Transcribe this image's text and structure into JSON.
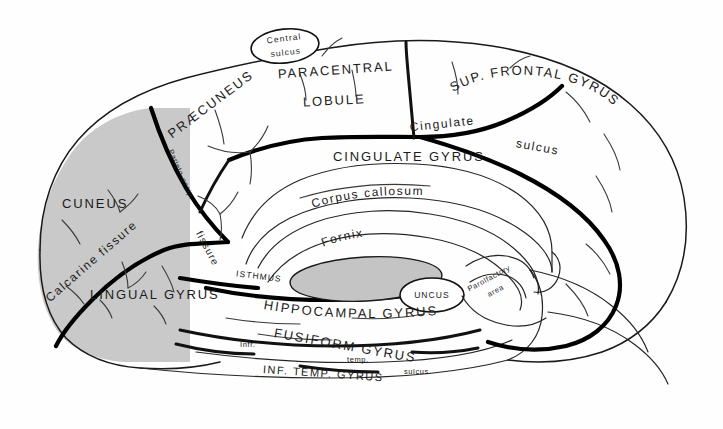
{
  "figure": {
    "background_color": "#fefefe",
    "ink_color": "#1a1a1a",
    "shade_color": "#c9c9c9"
  },
  "labels": {
    "central_sulcus_line1": "Central",
    "central_sulcus_line2": "sulcus",
    "paracentral_line1": "PARACENTRAL",
    "paracentral_line2": "LOBULE",
    "praecuneus": "PRÆCUNEUS",
    "parieto_occipital": "Parieto-occip.",
    "parieto_occipital_fissure": "fissure",
    "cuneus": "CUNEUS",
    "calcarine_fissure": "Calcarine fissure",
    "lingual_gyrus": "LINGUAL GYRUS",
    "sup_frontal_gyrus": "SUP. FRONTAL GYRUS",
    "cingulate_sulcus_a": "Cingulate",
    "cingulate_sulcus_b": "sulcus",
    "cingulate_gyrus": "CINGULATE GYRUS",
    "corpus_callosum": "Corpus callosum",
    "fornix": "Fornix",
    "isthmus": "ISTHMUS",
    "uncus": "UNCUS",
    "parolfactory_line1": "Parolfactory",
    "parolfactory_line2": "area",
    "hippocampal_gyrus": "HIPPOCAMPAL GYRUS",
    "fusiform_gyrus": "FUSIFORM GYRUS",
    "inf_temp_gyrus": "INF. TEMP. GYRUS",
    "infr_temp_line1": "Infr.",
    "infr_temp_line2": "temp.",
    "infr_temp_line3": "sulcus"
  },
  "structures": [
    {
      "name": "occipital-shaded-region",
      "shaded": true
    },
    {
      "name": "thalamus",
      "shaded": true
    },
    {
      "name": "corpus-callosum"
    },
    {
      "name": "fornix"
    },
    {
      "name": "cingulate-gyrus"
    },
    {
      "name": "uncus"
    },
    {
      "name": "brainstem"
    }
  ]
}
